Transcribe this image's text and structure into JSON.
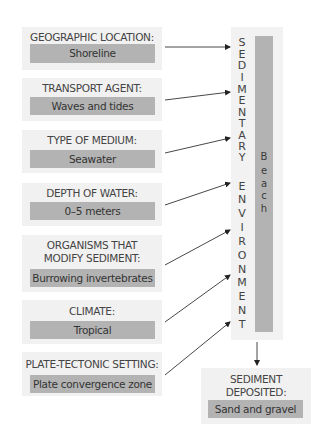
{
  "factors": [
    {
      "label": "GEOGRAPHIC LOCATION:",
      "value": "Shoreline"
    },
    {
      "label": "TRANSPORT AGENT:",
      "value": "Waves and tides"
    },
    {
      "label": "TYPE OF MEDIUM:",
      "value": "Seawater"
    },
    {
      "label": "DEPTH OF WATER:",
      "value": "0–5 meters"
    },
    {
      "label_line1": "ORGANISMS THAT",
      "label_line2": "MODIFY SEDIMENT:",
      "value": "Burrowing invertebrates"
    },
    {
      "label": "CLIMATE:",
      "value": "Tropical"
    },
    {
      "label": "PLATE-TECTONIC SETTING:",
      "value": "Plate convergence zone"
    }
  ],
  "environment": {
    "title": "SEDIMENTARY ENVIRONMENT",
    "letters": [
      "S",
      "E",
      "D",
      "I",
      "M",
      "E",
      "N",
      "T",
      "A",
      "R",
      "Y",
      "E",
      "N",
      "V",
      "I",
      "R",
      "O",
      "N",
      "M",
      "E",
      "N",
      "T"
    ],
    "example": "Beach",
    "example_letters": [
      "B",
      "e",
      "a",
      "c",
      "h"
    ]
  },
  "output": {
    "label_line1": "SEDIMENT",
    "label_line2": "DEPOSITED:",
    "value": "Sand and gravel"
  },
  "colors": {
    "panel": "#f1f1f1",
    "value_box": "#b3b3b3",
    "text": "#3a3a3a",
    "arrow": "#222222"
  }
}
